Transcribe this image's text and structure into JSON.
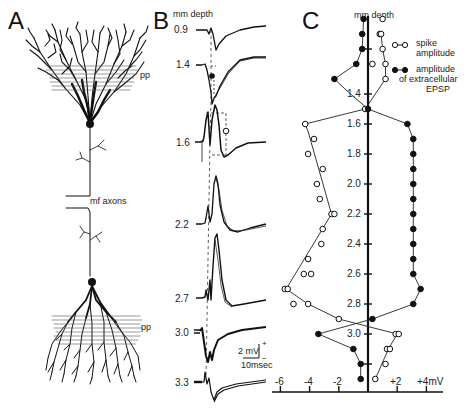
{
  "figure": {
    "panels": {
      "A": {
        "letter": "A",
        "labels": {
          "pp_top": "pp",
          "mf_axons": "mf axons",
          "pp_bottom": "pp"
        }
      },
      "B": {
        "letter": "B",
        "depth_header": "mm depth",
        "depths": [
          "0.9",
          "1.4",
          "1.6",
          "2.2",
          "2.7",
          "3.0",
          "3.3"
        ],
        "scale_bar": {
          "voltage": "2 mV",
          "time": "10msec",
          "plus": "+",
          "minus": "−"
        }
      },
      "C": {
        "letter": "C",
        "depth_header": "mm depth",
        "legend": {
          "open": {
            "line1": "spike",
            "line2": "amplitude"
          },
          "filled": {
            "line1": "amplitude",
            "line2": "of extracellular",
            "line3": "EPSP"
          }
        },
        "depth_ticks": [
          "1.4",
          "1.6",
          "1.8",
          "2.0",
          "2.2",
          "2.4",
          "2.6",
          "2.8",
          "3.0"
        ],
        "x_ticks": [
          "-6",
          "-4",
          "-2",
          "+2",
          "+4mV"
        ]
      }
    }
  },
  "chart_data": {
    "type": "scatter",
    "xlabel": "amplitude (mV)",
    "ylabel": "mm depth",
    "xlim": [
      -6.5,
      4.8
    ],
    "ylim": [
      3.35,
      0.9
    ],
    "x_ticks": [
      -6,
      -4,
      -2,
      2,
      4
    ],
    "y_ticks": [
      1.4,
      1.6,
      1.8,
      2.0,
      2.2,
      2.4,
      2.6,
      2.8,
      3.0
    ],
    "grid": false,
    "legend_position": "upper right",
    "series": [
      {
        "name": "spike amplitude",
        "marker": "open circle",
        "points": [
          {
            "depth": 0.9,
            "mV": 1.0
          },
          {
            "depth": 1.0,
            "mV": 0.8
          },
          {
            "depth": 1.0,
            "mV": 0.9
          },
          {
            "depth": 1.1,
            "mV": 1.0
          },
          {
            "depth": 1.2,
            "mV": 0.3
          },
          {
            "depth": 1.2,
            "mV": 1.2
          },
          {
            "depth": 1.3,
            "mV": 1.2
          },
          {
            "depth": 1.5,
            "mV": -0.2
          },
          {
            "depth": 1.6,
            "mV": -4.3
          },
          {
            "depth": 1.7,
            "mV": -3.7
          },
          {
            "depth": 1.8,
            "mV": -4.1
          },
          {
            "depth": 1.9,
            "mV": -3.1
          },
          {
            "depth": 2.0,
            "mV": -3.5
          },
          {
            "depth": 2.1,
            "mV": -3.3
          },
          {
            "depth": 2.2,
            "mV": -2.5
          },
          {
            "depth": 2.2,
            "mV": -2.3
          },
          {
            "depth": 2.3,
            "mV": -3.1
          },
          {
            "depth": 2.4,
            "mV": -3.2
          },
          {
            "depth": 2.5,
            "mV": -4.1
          },
          {
            "depth": 2.6,
            "mV": -4.4
          },
          {
            "depth": 2.6,
            "mV": -3.9
          },
          {
            "depth": 2.7,
            "mV": -5.7
          },
          {
            "depth": 2.7,
            "mV": -5.5
          },
          {
            "depth": 2.8,
            "mV": -5.1
          },
          {
            "depth": 2.8,
            "mV": -4.1
          },
          {
            "depth": 2.9,
            "mV": -2.0
          },
          {
            "depth": 3.0,
            "mV": 1.9
          },
          {
            "depth": 3.0,
            "mV": 2.1
          },
          {
            "depth": 3.1,
            "mV": 1.3
          },
          {
            "depth": 3.1,
            "mV": 1.5
          },
          {
            "depth": 3.2,
            "mV": 1.2
          },
          {
            "depth": 3.3,
            "mV": 0.5
          }
        ]
      },
      {
        "name": "amplitude of extracellular EPSP",
        "marker": "filled circle",
        "points": [
          {
            "depth": 0.9,
            "mV": -0.3
          },
          {
            "depth": 1.0,
            "mV": -0.4
          },
          {
            "depth": 1.1,
            "mV": -0.4
          },
          {
            "depth": 1.2,
            "mV": -0.8
          },
          {
            "depth": 1.3,
            "mV": -2.3
          },
          {
            "depth": 1.5,
            "mV": 0.0
          },
          {
            "depth": 1.6,
            "mV": 2.7
          },
          {
            "depth": 1.7,
            "mV": 3.1
          },
          {
            "depth": 1.8,
            "mV": 3.1
          },
          {
            "depth": 1.9,
            "mV": 3.1
          },
          {
            "depth": 2.0,
            "mV": 3.1
          },
          {
            "depth": 2.1,
            "mV": 3.1
          },
          {
            "depth": 2.2,
            "mV": 3.1
          },
          {
            "depth": 2.3,
            "mV": 3.1
          },
          {
            "depth": 2.4,
            "mV": 3.1
          },
          {
            "depth": 2.5,
            "mV": 3.1
          },
          {
            "depth": 2.6,
            "mV": 3.1
          },
          {
            "depth": 2.7,
            "mV": 3.6
          },
          {
            "depth": 2.8,
            "mV": 3.1
          },
          {
            "depth": 2.9,
            "mV": 0.3
          },
          {
            "depth": 3.0,
            "mV": -3.4
          },
          {
            "depth": 3.1,
            "mV": -1.0
          },
          {
            "depth": 3.2,
            "mV": -0.5
          },
          {
            "depth": 3.3,
            "mV": -0.5
          }
        ]
      }
    ]
  }
}
